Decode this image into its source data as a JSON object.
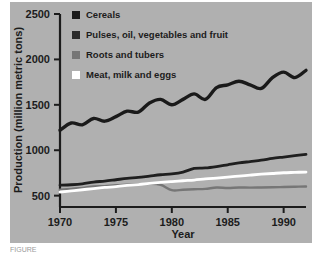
{
  "figure": {
    "panel_bg": "#b0b0b0",
    "page_bg": "#ffffff",
    "axis_color": "#1c1c1c",
    "caption_partial": "FIGURE"
  },
  "chart_data": {
    "type": "line",
    "title": "",
    "xlabel": "Year",
    "ylabel": "Production (million metric tons)",
    "xlim": [
      1970,
      1992
    ],
    "ylim": [
      375,
      2500
    ],
    "xticks": [
      1970,
      1975,
      1980,
      1985,
      1990
    ],
    "xtick_labels": [
      "1970",
      "1975",
      "1980",
      "1985",
      "1990"
    ],
    "yticks": [
      500,
      1000,
      1500,
      2000,
      2500
    ],
    "ytick_labels": [
      "500",
      "1000",
      "1500",
      "2000",
      "2500"
    ],
    "grid": false,
    "legend_position": "top-left-inside",
    "x": [
      1970,
      1971,
      1972,
      1973,
      1974,
      1975,
      1976,
      1977,
      1978,
      1979,
      1980,
      1981,
      1982,
      1983,
      1984,
      1985,
      1986,
      1987,
      1988,
      1989,
      1990,
      1991,
      1992
    ],
    "series": [
      {
        "name": "Cereals",
        "color": "#1a1a1a",
        "width": 3.4,
        "values": [
          1220,
          1300,
          1280,
          1350,
          1320,
          1370,
          1430,
          1420,
          1520,
          1560,
          1500,
          1560,
          1620,
          1560,
          1690,
          1720,
          1760,
          1720,
          1680,
          1800,
          1860,
          1800,
          1880
        ]
      },
      {
        "name": "Pulses, oil, vegetables and fruit",
        "color": "#1f1f1f",
        "width": 2.8,
        "values": [
          615,
          620,
          630,
          650,
          660,
          675,
          690,
          700,
          715,
          730,
          740,
          760,
          800,
          805,
          820,
          840,
          860,
          875,
          890,
          910,
          925,
          940,
          955
        ]
      },
      {
        "name": "Roots and tubers",
        "color": "#767676",
        "width": 2.4,
        "values": [
          565,
          575,
          585,
          600,
          605,
          615,
          620,
          625,
          630,
          620,
          560,
          565,
          570,
          575,
          590,
          585,
          590,
          588,
          590,
          592,
          595,
          598,
          600
        ]
      },
      {
        "name": "Meat, milk and eggs",
        "color": "#ffffff",
        "width": 2.8,
        "values": [
          540,
          552,
          565,
          578,
          590,
          600,
          612,
          622,
          634,
          645,
          655,
          664,
          672,
          684,
          694,
          704,
          716,
          726,
          736,
          744,
          752,
          756,
          760
        ]
      }
    ]
  },
  "legend": {
    "items": [
      {
        "label": "Cereals",
        "swatch": "#1a1a1a"
      },
      {
        "label": "Pulses, oil, vegetables and fruit",
        "swatch": "#2a2a2a"
      },
      {
        "label": "Roots and tubers",
        "swatch": "#767676"
      },
      {
        "label": "Meat, milk and eggs",
        "swatch": "#ffffff"
      }
    ]
  }
}
